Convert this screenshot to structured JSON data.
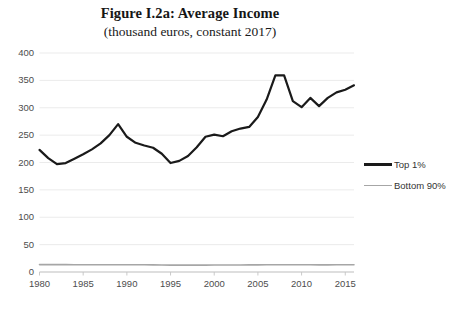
{
  "figure": {
    "title": "Figure I.2a: Average Income",
    "subtitle": "(thousand euros, constant 2017)"
  },
  "legend": {
    "position": "right",
    "entries": [
      {
        "label": "Top 1%",
        "color": "#1a1a1a"
      },
      {
        "label": "Bottom 90%",
        "color": "#a6a6a6"
      }
    ]
  },
  "axes": {
    "y_ticks": [
      "400",
      "350",
      "300",
      "250",
      "200",
      "150",
      "100",
      "50",
      "0"
    ],
    "x_ticks": [
      "1980",
      "1985",
      "1990",
      "1995",
      "2000",
      "2005",
      "2010",
      "2015"
    ]
  },
  "chart_data": {
    "type": "line",
    "title": "Figure I.2a: Average Income",
    "subtitle": "(thousand euros, constant 2017)",
    "xlabel": "",
    "ylabel": "",
    "xlim": [
      1980,
      2016
    ],
    "ylim": [
      0,
      400
    ],
    "ytick_step": 50,
    "xtick_step": 5,
    "grid": true,
    "grid_axis": "y",
    "legend_position": "right",
    "x": [
      1980,
      1981,
      1982,
      1983,
      1984,
      1985,
      1986,
      1987,
      1988,
      1989,
      1990,
      1991,
      1992,
      1993,
      1994,
      1995,
      1996,
      1997,
      1998,
      1999,
      2000,
      2001,
      2002,
      2003,
      2004,
      2005,
      2006,
      2007,
      2008,
      2009,
      2010,
      2011,
      2012,
      2013,
      2014,
      2015,
      2016
    ],
    "series": [
      {
        "name": "Top 1%",
        "color": "#1a1a1a",
        "linewidth": 2.2,
        "values": [
          223,
          208,
          197,
          199,
          207,
          215,
          224,
          235,
          250,
          270,
          247,
          236,
          231,
          227,
          216,
          199,
          203,
          212,
          228,
          247,
          251,
          248,
          257,
          262,
          265,
          283,
          315,
          359,
          359,
          312,
          301,
          318,
          303,
          318,
          328,
          333,
          341
        ]
      },
      {
        "name": "Bottom 90%",
        "color": "#a6a6a6",
        "linewidth": 1.6,
        "values": [
          13.5,
          13.5,
          13.4,
          13.4,
          13.3,
          13.3,
          13.2,
          13.2,
          13.2,
          13.3,
          13.3,
          13.3,
          13.2,
          13.0,
          12.8,
          12.6,
          12.5,
          12.5,
          12.5,
          12.6,
          12.7,
          12.8,
          12.9,
          12.9,
          13.0,
          13.1,
          13.2,
          13.3,
          13.3,
          13.2,
          13.2,
          13.2,
          13.1,
          13.1,
          13.2,
          13.2,
          13.3
        ]
      }
    ]
  }
}
